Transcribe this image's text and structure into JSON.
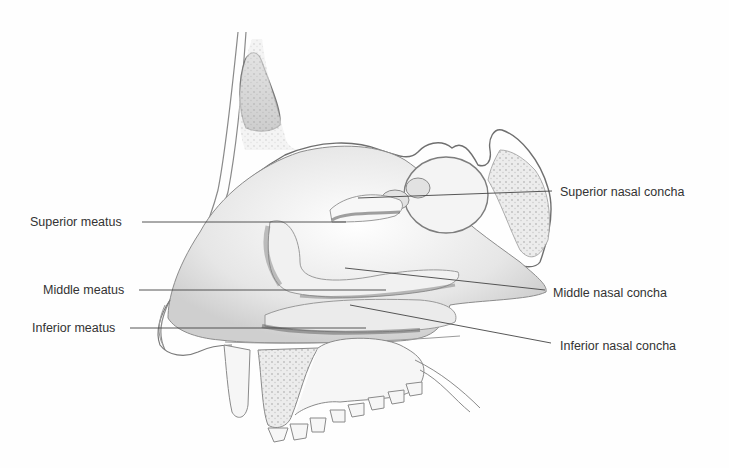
{
  "figure": {
    "colors": {
      "background": "#fefefe",
      "ink": "#333333",
      "shade_light": "#e8e8e8",
      "shade_mid": "#c4c4c4",
      "shade_dark": "#8a8a8a"
    }
  },
  "labels": {
    "left": [
      {
        "id": "superior-meatus",
        "text": "Superior meatus"
      },
      {
        "id": "middle-meatus",
        "text": "Middle meatus"
      },
      {
        "id": "inferior-meatus",
        "text": "Inferior meatus"
      }
    ],
    "right": [
      {
        "id": "superior-nasal-concha",
        "text": "Superior nasal concha"
      },
      {
        "id": "middle-nasal-concha",
        "text": "Middle nasal concha"
      },
      {
        "id": "inferior-nasal-concha",
        "text": "Inferior nasal concha"
      }
    ]
  }
}
